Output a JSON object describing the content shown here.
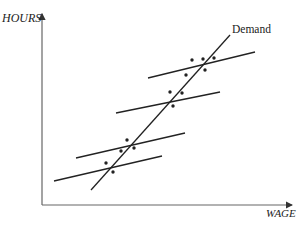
{
  "diagram": {
    "y_axis_label": "HOURS",
    "x_axis_label": "WAGE",
    "demand_label": "Demand",
    "colors": {
      "ink": "#222222",
      "axis": "#555555",
      "background": "#ffffff"
    }
  },
  "geometry": {
    "demand_line": {
      "x1": 91,
      "y1": 190,
      "x2": 230,
      "y2": 35
    },
    "supply_lines": [
      {
        "x1": 148,
        "y1": 78,
        "x2": 255,
        "y2": 52
      },
      {
        "x1": 116,
        "y1": 113,
        "x2": 220,
        "y2": 92
      },
      {
        "x1": 76,
        "y1": 158,
        "x2": 185,
        "y2": 133
      },
      {
        "x1": 54,
        "y1": 181,
        "x2": 162,
        "y2": 156
      }
    ],
    "dots": [
      [
        192,
        60
      ],
      [
        203,
        59
      ],
      [
        214,
        58
      ],
      [
        186,
        75
      ],
      [
        205,
        70
      ],
      [
        170,
        92
      ],
      [
        182,
        93
      ],
      [
        173,
        106
      ],
      [
        127,
        140
      ],
      [
        134,
        148
      ],
      [
        121,
        151
      ],
      [
        106,
        163
      ],
      [
        113,
        172
      ]
    ]
  }
}
